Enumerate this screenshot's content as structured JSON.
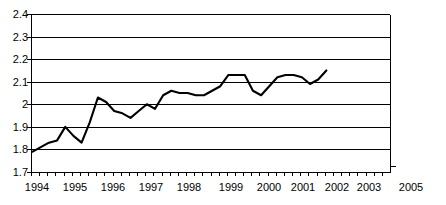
{
  "chart_data": {
    "type": "line",
    "title": "",
    "subtitle": "",
    "xlabel": "",
    "ylabel": "",
    "grid": true,
    "legend": false,
    "legend_position": "none",
    "line_color": "#000000",
    "grid_color": "#000000",
    "background_color": "#ffffff",
    "ylim": [
      1.7,
      2.4
    ],
    "ytick_labels": [
      "2.4",
      "2.3",
      "2.2",
      "2.1",
      "2",
      "1.9",
      "1.8",
      "1.7"
    ],
    "ytick_values": [
      2.4,
      2.3,
      2.2,
      2.1,
      2.0,
      1.9,
      1.8,
      1.7
    ],
    "xlim": [
      1994.0,
      2005.0
    ],
    "xtick_labels": [
      "1994",
      "1995",
      "1996",
      "1997",
      "1998",
      "1999",
      "2000",
      "2001",
      "2002",
      "2003",
      "2005"
    ],
    "xtick_values": [
      1994,
      1995,
      1996,
      1997,
      1998,
      1999,
      2000,
      2001,
      2002,
      2003,
      2005
    ],
    "minor_ticks_per_year": 4,
    "x": [
      1994.05,
      1994.3,
      1994.55,
      1994.8,
      1995.05,
      1995.3,
      1995.55,
      1995.8,
      1996.05,
      1996.3,
      1996.55,
      1996.8,
      1997.05,
      1997.3,
      1997.55,
      1997.8,
      1998.05,
      1998.3,
      1998.55,
      1998.8,
      1999.05,
      1999.3,
      1999.55,
      1999.8,
      2000.05,
      2000.3,
      2000.55,
      2000.8,
      2001.05,
      2001.3,
      2001.55,
      2001.8,
      2002.05,
      2002.3,
      2002.55,
      2002.8,
      2003.05
    ],
    "values": [
      1.79,
      1.81,
      1.83,
      1.84,
      1.9,
      1.86,
      1.83,
      1.92,
      2.03,
      2.01,
      1.97,
      1.96,
      1.94,
      1.97,
      2.0,
      1.98,
      2.04,
      2.06,
      2.05,
      2.05,
      2.04,
      2.04,
      2.06,
      2.08,
      2.13,
      2.13,
      2.13,
      2.06,
      2.04,
      2.08,
      2.12,
      2.13,
      2.13,
      2.12,
      2.09,
      2.11,
      2.15
    ],
    "series": [
      {
        "name": "series-1",
        "color": "#000000",
        "values": [
          1.79,
          1.81,
          1.83,
          1.84,
          1.9,
          1.86,
          1.83,
          1.92,
          2.03,
          2.01,
          1.97,
          1.96,
          1.94,
          1.97,
          2.0,
          1.98,
          2.04,
          2.06,
          2.05,
          2.05,
          2.04,
          2.04,
          2.06,
          2.08,
          2.13,
          2.13,
          2.13,
          2.06,
          2.04,
          2.08,
          2.12,
          2.13,
          2.13,
          2.12,
          2.09,
          2.11,
          2.15
        ]
      }
    ],
    "annotations": []
  },
  "geometry": {
    "plot_left": 31,
    "plot_right": 390,
    "plot_top": 14,
    "plot_bottom": 172,
    "year_label_y": 182,
    "year_x_positions": [
      37,
      75,
      113,
      151,
      189,
      231,
      269,
      303,
      337,
      369,
      411
    ]
  }
}
